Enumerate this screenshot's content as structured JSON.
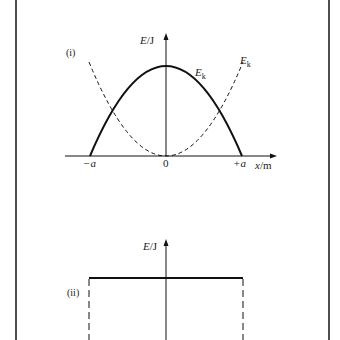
{
  "figure": {
    "panel_i": {
      "tag": "(i)",
      "y_axis_label_var": "E",
      "y_axis_label_unit": "/J",
      "x_axis_label_var": "x",
      "x_axis_label_unit": "/m",
      "x_ticks": {
        "neg": "−a",
        "zero": "0",
        "pos": "+a"
      },
      "curves": [
        {
          "name": "solid-parabola",
          "label_main": "E",
          "label_sub": "k",
          "style": "solid",
          "shape": "inverted parabola, max at x=0, zero at x=±a"
        },
        {
          "name": "dashed-parabola",
          "label_main": "E",
          "label_sub": "k",
          "style": "dashed",
          "shape": "upright parabola, zero at x=0"
        }
      ]
    },
    "panel_ii": {
      "tag": "(ii)",
      "y_axis_label_var": "E",
      "y_axis_label_unit": "/J",
      "curves": [
        {
          "name": "constant-total-energy",
          "style": "solid",
          "shape": "horizontal line from −a to +a"
        },
        {
          "name": "boundary-left",
          "style": "dashed",
          "shape": "vertical line at −a"
        },
        {
          "name": "boundary-right",
          "style": "dashed",
          "shape": "vertical line at +a"
        }
      ]
    },
    "colors": {
      "line": "#111111",
      "frame": "#222222",
      "background": "#ffffff"
    }
  }
}
